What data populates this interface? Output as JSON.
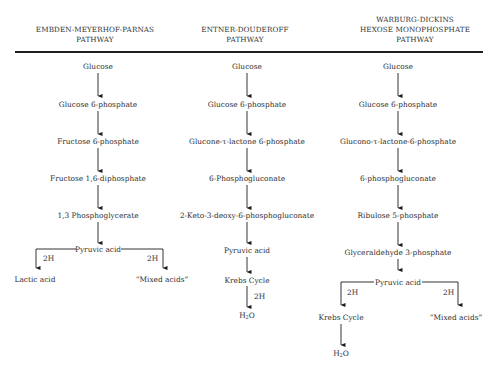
{
  "headers": {
    "emp": {
      "line1": "EMBDEN-MEYERHOF-PARNAS",
      "line2": "PATHWAY"
    },
    "ed": {
      "line1": "ENTNER-DOUDEROFF",
      "line2": "PATHWAY"
    },
    "wd": {
      "line1": "WARBURG-DICKINS",
      "line2": "HEXOSE MONOPHOSPHATE",
      "line3": "PATHWAY"
    }
  },
  "emp": {
    "nodes": [
      "Glucose",
      "Glucose 6-phosphate",
      "Fructose 6-phosphate",
      "Fructose 1,6-diphosphate",
      "1,3 Phosphoglycerate",
      "Pyruvic acid"
    ],
    "branch_left": {
      "label": "2H",
      "product": "Lactic acid"
    },
    "branch_right": {
      "label": "2H",
      "product": "“Mixed acids”"
    }
  },
  "ed": {
    "nodes": [
      "Glucose",
      "Glucose 6-phosphate",
      "Glucone-τ-lactone 6-phosphate",
      "6-Phosphogluconate",
      "2-Keto-3-deoxy-6-phosphogluconate",
      "Pyruvic acid",
      "Krebs Cycle"
    ],
    "final_label": "2H",
    "final_product_main": "H",
    "final_product_sub": "2",
    "final_product_tail": "O"
  },
  "wd": {
    "nodes": [
      "Glucose",
      "Glucose 6-phosphate",
      "Glucono-τ-lactone-6-phosphate",
      "6-phosphogluconate",
      "Ribulose 5-phosphate",
      "Glyceraldehyde 3-phosphate",
      "Pyruvic acid"
    ],
    "branch_left": {
      "label": "2H",
      "product": "Krebs Cycle"
    },
    "branch_right": {
      "label": "2H",
      "product": "“Mixed acids”"
    },
    "final_product_main": "H",
    "final_product_sub": "2",
    "final_product_tail": "O"
  }
}
